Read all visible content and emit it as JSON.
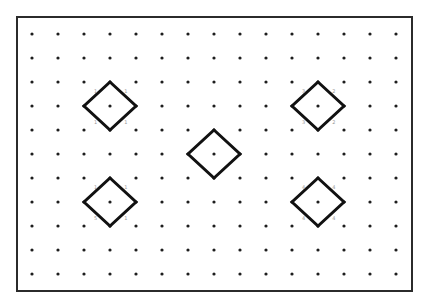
{
  "diagram": {
    "type": "dot-grid-diagram",
    "frame": {
      "x": 17,
      "y": 17,
      "width": 395,
      "height": 274,
      "stroke": "#2b2b2b"
    },
    "grid": {
      "columns": 15,
      "rows": 11,
      "origin_x": 32,
      "origin_y": 34,
      "spacing_x": 26,
      "spacing_y": 24,
      "dot_color": "#1e1e1e",
      "dot_radius": 1.6
    },
    "diamonds": [
      {
        "id": "diamond-top-left",
        "col": 3,
        "row": 3,
        "labels": {
          "top_left": "1",
          "top_right": "1",
          "bottom_left": "1",
          "bottom_right": "1"
        }
      },
      {
        "id": "diamond-top-right",
        "col": 11,
        "row": 3,
        "labels": {
          "top_left": "3",
          "top_right": "2",
          "bottom_left": "3",
          "bottom_right": "2"
        }
      },
      {
        "id": "diamond-center",
        "col": 7,
        "row": 5,
        "labels": {}
      },
      {
        "id": "diamond-bottom-left",
        "col": 3,
        "row": 7,
        "labels": {
          "top_left": "1",
          "top_right": "1",
          "bottom_left": "5",
          "bottom_right": "1"
        }
      },
      {
        "id": "diamond-bottom-right",
        "col": 11,
        "row": 7,
        "labels": {
          "top_left": "4",
          "top_right": "4",
          "bottom_left": "4",
          "bottom_right": "4"
        }
      }
    ],
    "diamond_style": {
      "stroke": "#111111",
      "stroke_width": 3,
      "half_diagonal_cols": 1,
      "half_diagonal_rows": 1
    }
  }
}
